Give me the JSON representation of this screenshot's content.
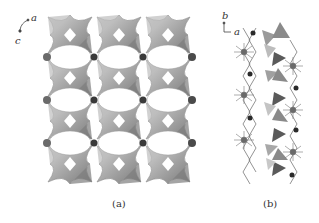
{
  "figure": {
    "panels": [
      {
        "id": "a",
        "caption": "(a)",
        "axes": {
          "horizontal": "a",
          "vertical": "c"
        },
        "description": "Framework view along b: corner-sharing tetrahedral clusters forming elliptical channels"
      },
      {
        "id": "b",
        "caption": "(b)",
        "axes": {
          "vertical": "b",
          "horizontal": "a"
        },
        "description": "Side view of chain with tetrahedra and star-shaped coordination centers"
      }
    ],
    "colors": {
      "tetra_light": "#c8c8c8",
      "tetra_mid": "#9a9a9a",
      "tetra_dark": "#6a6a6a",
      "node": "#3a3a3a",
      "bond": "#555555"
    }
  }
}
